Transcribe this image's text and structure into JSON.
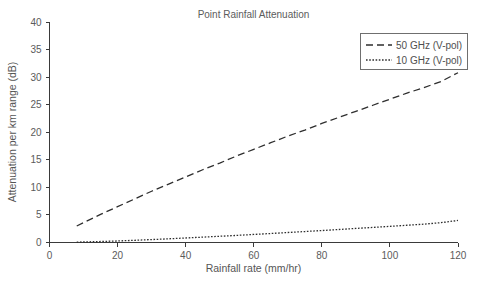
{
  "chart_data": {
    "type": "line",
    "title": "Point Rainfall Attenuation",
    "xlabel": "Rainfall rate (mm/hr)",
    "ylabel": "Attenuation per km range (dB)",
    "xlim": [
      0,
      120
    ],
    "ylim": [
      0,
      40
    ],
    "xticks": [
      0,
      20,
      40,
      60,
      80,
      100,
      120
    ],
    "yticks": [
      0,
      5,
      10,
      15,
      20,
      25,
      30,
      35,
      40
    ],
    "grid": false,
    "legend_position": "upper right",
    "series": [
      {
        "name": "50 GHz (V-pol)",
        "style": "dashed",
        "color": "#2e2e2e",
        "x": [
          8,
          10,
          15,
          20,
          25,
          30,
          35,
          40,
          45,
          50,
          55,
          60,
          65,
          70,
          75,
          80,
          85,
          90,
          95,
          100,
          105,
          110,
          115,
          120
        ],
        "values": [
          3.0,
          3.6,
          5.1,
          6.5,
          7.9,
          9.3,
          10.6,
          11.9,
          13.2,
          14.4,
          15.7,
          16.9,
          18.1,
          19.3,
          20.4,
          21.6,
          22.7,
          23.8,
          24.9,
          26.0,
          27.1,
          28.1,
          29.2,
          30.8
        ]
      },
      {
        "name": "10 GHz (V-pol)",
        "style": "dotted",
        "color": "#2e2e2e",
        "x": [
          8,
          10,
          15,
          20,
          25,
          30,
          35,
          40,
          45,
          50,
          55,
          60,
          65,
          70,
          75,
          80,
          85,
          90,
          95,
          100,
          105,
          110,
          115,
          120
        ],
        "values": [
          0.06,
          0.1,
          0.18,
          0.28,
          0.4,
          0.53,
          0.67,
          0.82,
          0.97,
          1.13,
          1.29,
          1.46,
          1.63,
          1.81,
          1.99,
          2.17,
          2.36,
          2.55,
          2.74,
          2.93,
          3.13,
          3.33,
          3.6,
          4.0
        ]
      }
    ]
  },
  "legend": {
    "entries": [
      {
        "label": "50 GHz (V-pol)"
      },
      {
        "label": "10 GHz (V-pol)"
      }
    ]
  },
  "colors": {
    "axis": "#3a3a3a",
    "text": "#5a5a5a",
    "series": "#2e2e2e",
    "background": "#ffffff"
  }
}
